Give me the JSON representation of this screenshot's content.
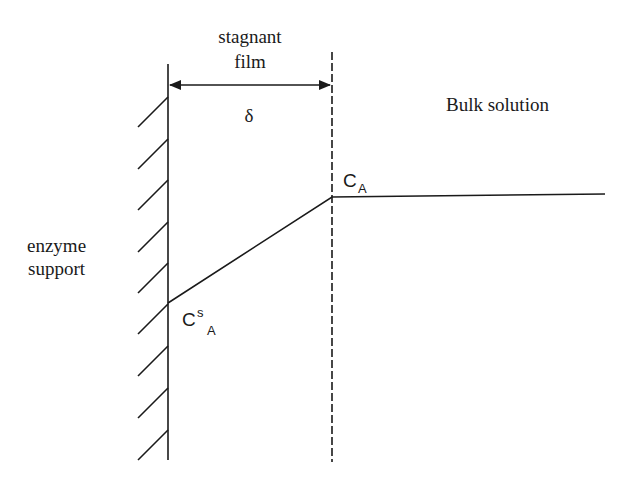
{
  "diagram": {
    "labels": {
      "stagnant_line1": "stagnant",
      "stagnant_line2": "film",
      "delta": "δ",
      "bulk_solution": "Bulk solution",
      "enzyme_line1": "enzyme",
      "enzyme_line2": "support",
      "ca_main": "C",
      "ca_sub": "A",
      "cs_main": "C",
      "cs_sup": "s",
      "cs_sub": "A"
    },
    "colors": {
      "ink": "#1a1a1a",
      "background": "#ffffff"
    }
  }
}
